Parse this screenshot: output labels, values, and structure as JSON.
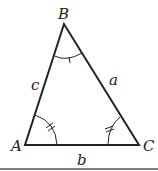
{
  "figure": {
    "vertices": {
      "A": {
        "label": "A",
        "x": 25,
        "y": 145
      },
      "B": {
        "label": "B",
        "x": 64,
        "y": 24
      },
      "C": {
        "label": "C",
        "x": 139,
        "y": 145
      }
    },
    "sides": {
      "a": {
        "label": "a",
        "opposite": "A"
      },
      "b": {
        "label": "b",
        "opposite": "B"
      },
      "c": {
        "label": "c",
        "opposite": "C"
      }
    },
    "angle_marks": {
      "A": "double tick arc",
      "B": "single tick arc",
      "C": "double tick arc"
    },
    "colors": {
      "stroke": "#222222",
      "rule": "#555555",
      "background": "#ffffff"
    }
  }
}
